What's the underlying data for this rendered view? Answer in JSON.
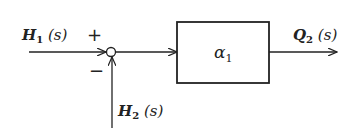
{
  "diagram": {
    "type": "block-diagram",
    "colors": {
      "line": "#222222",
      "background": "#ffffff"
    },
    "input_top": {
      "symbol": "H",
      "subscript": "1",
      "arg": "(s)"
    },
    "input_bottom": {
      "symbol": "H",
      "subscript": "2",
      "arg": "(s)"
    },
    "summing_junction": {
      "plus_sign": "+",
      "minus_sign": "−"
    },
    "block": {
      "symbol": "α",
      "subscript": "1"
    },
    "output": {
      "symbol": "Q",
      "subscript": "2",
      "arg": "(s)"
    }
  }
}
